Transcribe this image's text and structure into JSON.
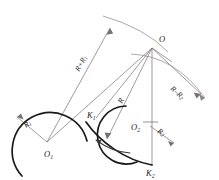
{
  "figure": {
    "background_color": "#ffffff",
    "line_color": "#777073",
    "curve_color": "#1b1b1b"
  },
  "points": {
    "O": {
      "label": "O",
      "sub": "",
      "x": 153,
      "y": 47
    },
    "O1": {
      "label": "O",
      "sub": "1",
      "x": 48,
      "y": 144
    },
    "O2": {
      "label": "O",
      "sub": "2",
      "x": 148,
      "y": 126
    },
    "K1": {
      "label": "K",
      "sub": "1",
      "x": 93,
      "y": 117
    },
    "K2": {
      "label": "K",
      "sub": "2",
      "x": 152,
      "y": 165
    }
  },
  "dimensions": {
    "R_plus_R1": {
      "text": "R+R",
      "sub": "1"
    },
    "R_minus_R2": {
      "text": "R–R",
      "sub": "2"
    },
    "R": {
      "text": "R",
      "sub": ""
    },
    "R1": {
      "text": "R",
      "sub": "1"
    },
    "R2": {
      "text": "R",
      "sub": "2"
    }
  },
  "elements": {
    "left_circle": "arc-circle-O1",
    "right_circle": "arc-circle-O2",
    "s_curve": "transition-s-curve",
    "outer_arc_top": "arc-through-O-upper",
    "outer_arc_right": "arc-through-O-right",
    "ray_O1_to_O": "radius-line-R-plus-R1",
    "ray_O_to_O2": "radius-line-R-minus-R2",
    "ray_O1_O": "radius-line-R"
  }
}
